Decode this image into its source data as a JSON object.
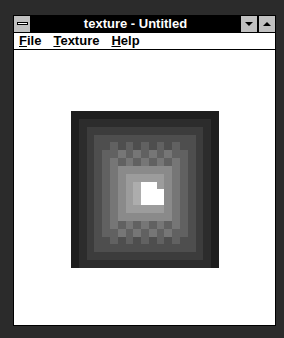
{
  "window": {
    "title": "texture - Untitled",
    "controls": {
      "system_menu_icon": "system-menu-icon",
      "minimize_icon": "triangle-down-icon",
      "maximize_icon": "triangle-up-icon"
    }
  },
  "menubar": {
    "items": [
      {
        "label": "File",
        "mnemonic": "F",
        "rest": "ile"
      },
      {
        "label": "Texture",
        "mnemonic": "T",
        "rest": "exture"
      },
      {
        "label": "Help",
        "mnemonic": "H",
        "rest": "elp"
      }
    ]
  },
  "texture": {
    "description": "Concentric grayscale square texture, dark edges to bright center with small white blob",
    "grid_cols": 19,
    "grid_rows": 20,
    "ring_colors": [
      "#1e1e1e",
      "#2c2c2c",
      "#3c3c3c",
      "#4e4e4e",
      "#616161",
      "#767676",
      "#8a8a8a",
      "#9c9c9c",
      "#adadad",
      "#b8b8b8",
      "#ffffff"
    ],
    "center_white_cells": [
      [
        9,
        9
      ],
      [
        9,
        10
      ],
      [
        10,
        9
      ],
      [
        10,
        10
      ],
      [
        10,
        11
      ],
      [
        11,
        9
      ],
      [
        11,
        10
      ],
      [
        11,
        11
      ]
    ]
  }
}
